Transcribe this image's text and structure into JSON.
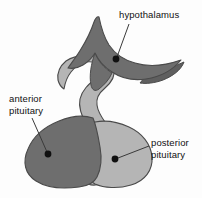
{
  "figure": {
    "background_color": "#fdfdfd",
    "frame_color": "#cfcfcf"
  },
  "palette": {
    "dark_gray": "#6e6e6e",
    "light_gray": "#b5b5b5",
    "outline": "#4a4a4a",
    "leader_line": "#3a3a3a",
    "dot": "#101010",
    "text": "#111111"
  },
  "labels": [
    {
      "id": "hypothalamus",
      "line1": "hypothalamus",
      "line2": "",
      "text_x": 119,
      "text_y": 9,
      "leader_from": [
        128,
        24
      ],
      "leader_to": [
        117,
        58
      ],
      "dot": [
        116,
        59
      ],
      "region": "dark_gray"
    },
    {
      "id": "anterior-pituitary",
      "line1": "anterior",
      "line2": "pituitary",
      "text_x": 9,
      "text_y": 93,
      "leader_from": [
        32,
        118
      ],
      "leader_to": [
        47,
        153
      ],
      "dot": [
        48,
        154
      ],
      "region": "dark_gray"
    },
    {
      "id": "posterior-pituitary",
      "line1": "posterior",
      "line2": "pituitary",
      "text_x": 151,
      "text_y": 137,
      "leader_from": [
        148,
        146
      ],
      "leader_to": [
        117,
        158
      ],
      "dot": [
        115,
        159
      ],
      "region": "light_gray"
    }
  ],
  "shapes": {
    "hypothalamus_label_note": "dark gray wing-shaped mass at top",
    "infundibulum_label_note": "light gray stalk descending from hypothalamus",
    "anterior_lobe_note": "dark gray rounded lobe at lower left",
    "posterior_lobe_note": "light gray rounded lobe at lower right"
  }
}
